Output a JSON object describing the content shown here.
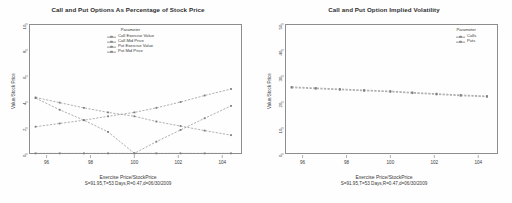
{
  "chart_data": [
    {
      "type": "line",
      "title": "Call and Put Options As Percentage of Stock Price",
      "xlabel": "Exercise Price/StockPrice",
      "subtitle": "S=91.95,T=53 Days,R=0.47,d=06/30/2009",
      "ylabel": "Value/Stock Price",
      "xlim": [
        95.2,
        104.9
      ],
      "ylim": [
        0,
        10
      ],
      "xticks": [
        96,
        98,
        100,
        102,
        104
      ],
      "yticks": [
        0,
        2,
        4,
        6,
        8,
        10
      ],
      "grid": false,
      "legend_title": "Parameter",
      "legend_position": "top-center",
      "x": [
        95.5,
        96.6,
        97.7,
        98.8,
        100.0,
        101.0,
        102.1,
        103.2,
        104.4
      ],
      "series": [
        {
          "name": "Call Exercise Value",
          "values": [
            4.3,
            3.4,
            2.6,
            1.7,
            0.05,
            0.05,
            0.05,
            0.05,
            0.05
          ]
        },
        {
          "name": "Call Mid Price",
          "values": [
            4.35,
            3.95,
            3.55,
            3.2,
            2.9,
            2.5,
            2.15,
            1.8,
            1.45
          ]
        },
        {
          "name": "Put Exercise Value",
          "values": [
            0.05,
            0.05,
            0.05,
            0.05,
            0.05,
            0.95,
            1.85,
            2.75,
            3.7
          ]
        },
        {
          "name": "Put Mid Price",
          "values": [
            2.1,
            2.35,
            2.6,
            2.9,
            3.2,
            3.55,
            4.0,
            4.5,
            5.0
          ]
        }
      ]
    },
    {
      "type": "line",
      "title": "Call and Put Option Implied Volatility",
      "xlabel": "Exercise Price/StockPrice",
      "subtitle": "S=91.95,T=53 Days,R=0.47,d=06/30/2009",
      "ylabel": "Value/Stock Price",
      "xlim": [
        95.2,
        104.9
      ],
      "ylim": [
        0,
        50
      ],
      "xticks": [
        96,
        98,
        100,
        102,
        104
      ],
      "yticks": [
        0,
        10,
        20,
        30,
        40,
        50
      ],
      "grid": false,
      "legend_title": "Parameter",
      "legend_position": "top-right",
      "x": [
        95.5,
        96.6,
        97.7,
        98.8,
        100.0,
        101.0,
        102.1,
        103.2,
        104.4
      ],
      "series": [
        {
          "name": "Calls",
          "values": [
            25.8,
            25.4,
            25.0,
            24.6,
            24.2,
            23.7,
            23.2,
            22.7,
            22.3
          ]
        },
        {
          "name": "Puts",
          "values": [
            25.5,
            25.1,
            24.7,
            24.3,
            23.9,
            23.4,
            22.9,
            22.4,
            22.0
          ]
        }
      ]
    }
  ],
  "colors": {
    "line": "#8f8f8f",
    "frame": "#8d8d8d",
    "text": "#3a3a3a",
    "background": "#ffffff"
  }
}
